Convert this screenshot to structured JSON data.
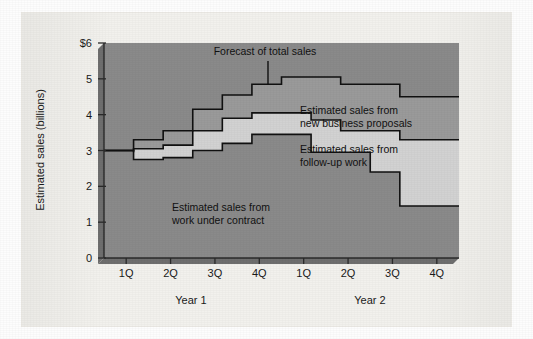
{
  "chart_data": {
    "type": "area",
    "title": "",
    "xlabel": "",
    "ylabel": "Estimated sales (billions)",
    "ylim": [
      0,
      6
    ],
    "grid": false,
    "legend_position": "inline-annotations",
    "x_tick_labels": [
      "1Q",
      "2Q",
      "3Q",
      "4Q",
      "1Q",
      "2Q",
      "3Q",
      "4Q"
    ],
    "y_tick_labels": [
      "$6",
      "5",
      "4",
      "3",
      "2",
      "1",
      "0"
    ],
    "y_tick_values": [
      6,
      5,
      4,
      3,
      2,
      1,
      0
    ],
    "group_labels": [
      "Year 1",
      "Year 2"
    ],
    "categories": [
      "Y1-1Q-a",
      "Y1-1Q-b",
      "Y1-2Q-a",
      "Y1-2Q-b",
      "Y1-3Q-a",
      "Y1-3Q-b",
      "Y1-4Q-a",
      "Y1-4Q-b",
      "Y2-1Q",
      "Y2-2Q",
      "Y2-3Q",
      "Y2-4Q"
    ],
    "series": [
      {
        "name": "Estimated sales from work under contract",
        "color": "#888888",
        "values": [
          2.75,
          2.75,
          2.8,
          3.0,
          3.2,
          3.45,
          3.45,
          2.95,
          2.95,
          2.4,
          1.45,
          1.45
        ]
      },
      {
        "name": "Estimated sales from follow-up work",
        "color": "#d2d2d2",
        "values": [
          2.95,
          3.05,
          3.15,
          3.55,
          3.9,
          4.05,
          4.05,
          3.85,
          3.55,
          3.55,
          3.3,
          3.3
        ]
      },
      {
        "name": "Estimated sales from new business proposals",
        "color": "#8a8a8a",
        "values": [
          3.1,
          3.3,
          3.55,
          4.15,
          4.55,
          4.85,
          5.05,
          5.05,
          4.85,
          4.85,
          4.5,
          4.5
        ]
      }
    ],
    "baseline_value": 3.0,
    "annotations": [
      {
        "id": "forecast-total",
        "text_line_1": "Forecast of total sales",
        "text_line_2": "",
        "leader": true
      },
      {
        "id": "new-business",
        "text_line_1": "Estimated sales from",
        "text_line_2": "new business proposals",
        "leader": false
      },
      {
        "id": "follow-up",
        "text_line_1": "Estimated sales from",
        "text_line_2": "follow-up work",
        "leader": false
      },
      {
        "id": "under-contract",
        "text_line_1": "Estimated sales from",
        "text_line_2": "work under contract",
        "leader": false
      }
    ],
    "colors": {
      "plot_background_dark": "#8a8a8a",
      "band_light": "#d2d2d2",
      "band_mid": "#9a9a9a",
      "line": "#111111",
      "page": "#f2f1ed"
    }
  },
  "axis": {
    "y_label": "Estimated sales (billions)",
    "y_ticks": [
      "$6",
      "5",
      "4",
      "3",
      "2",
      "1",
      "0"
    ],
    "x_ticks": [
      "1Q",
      "2Q",
      "3Q",
      "4Q",
      "1Q",
      "2Q",
      "3Q",
      "4Q"
    ],
    "year_1": "Year 1",
    "year_2": "Year 2"
  },
  "annotations": {
    "forecast": "Forecast of total sales",
    "new_business_l1": "Estimated sales from",
    "new_business_l2": "new business proposals",
    "follow_up_l1": "Estimated sales from",
    "follow_up_l2": "follow-up work",
    "under_contract_l1": "Estimated sales from",
    "under_contract_l2": "work under contract"
  }
}
